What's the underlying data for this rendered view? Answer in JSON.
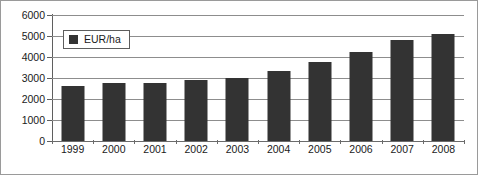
{
  "chart_data": {
    "type": "bar",
    "title": "",
    "xlabel": "",
    "ylabel": "",
    "categories": [
      "1999",
      "2000",
      "2001",
      "2002",
      "2003",
      "2004",
      "2005",
      "2006",
      "2007",
      "2008"
    ],
    "values": [
      2600,
      2750,
      2780,
      2900,
      3000,
      3350,
      3750,
      4250,
      4800,
      5100
    ],
    "series": [
      {
        "name": "EUR/ha",
        "values": [
          2600,
          2750,
          2780,
          2900,
          3000,
          3350,
          3750,
          4250,
          4800,
          5100
        ],
        "color": "#333333"
      }
    ],
    "ylim": [
      0,
      6000
    ],
    "ytick_labels": [
      "0",
      "1000",
      "2000",
      "3000",
      "4000",
      "5000",
      "6000"
    ],
    "ytick_values": [
      0,
      1000,
      2000,
      3000,
      4000,
      5000,
      6000
    ],
    "grid": true,
    "legend": {
      "position": "top-left-inside",
      "entries": [
        {
          "label": "EUR/ha",
          "marker": "square",
          "color": "#333333"
        }
      ]
    },
    "colors": {
      "bar": "#333333",
      "gridline": "#8d8d8d",
      "axis": "#5f5f5f",
      "border": "#9a9a9a",
      "text": "#1a1a1a",
      "background": "#ffffff"
    }
  }
}
